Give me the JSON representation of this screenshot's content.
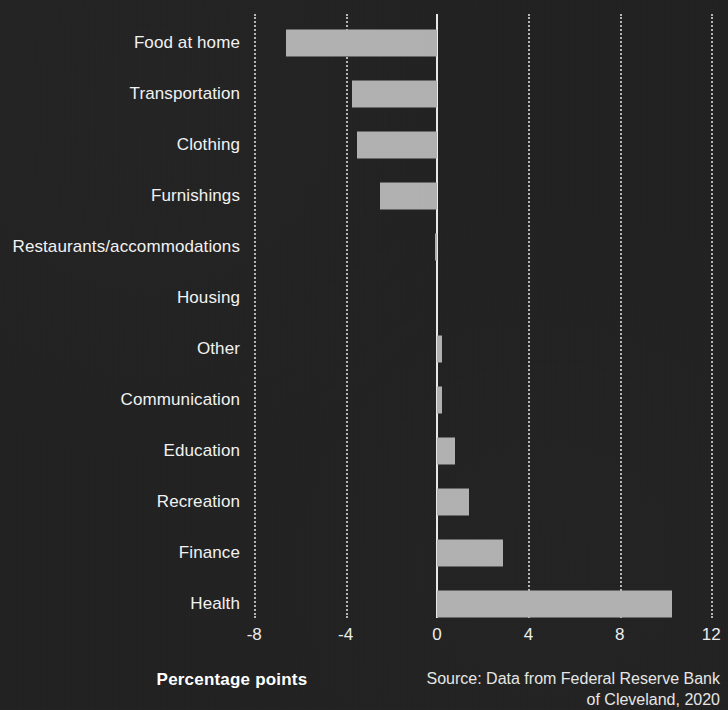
{
  "theme": {
    "background": "#212121",
    "bar_color": "#b0b0b0",
    "text_color": "#f2f2f2",
    "grid_color": "#cfcfcf",
    "zero_line_color": "#e8e8e8"
  },
  "footer": {
    "axis_title": "Percentage points",
    "source_line1": "Source: Data from Federal Reserve Bank",
    "source_line2": "of Cleveland, 2020"
  },
  "chart_data": {
    "type": "bar",
    "orientation": "horizontal",
    "title": "",
    "subtitle": "",
    "xlabel": "Percentage points",
    "ylabel": "",
    "xlim": [
      -8,
      12
    ],
    "xticks": [
      -8,
      -4,
      0,
      4,
      8,
      12
    ],
    "xtick_labels": [
      "-8",
      "-4",
      "0",
      "4",
      "8",
      "12"
    ],
    "grid": "vertical-dotted",
    "legend": "none",
    "zero_reference_line": true,
    "categories": [
      "Food at home",
      "Transportation",
      "Clothing",
      "Furnishings",
      "Restaurants/accommodations",
      "Housing",
      "Other",
      "Communication",
      "Education",
      "Recreation",
      "Finance",
      "Health"
    ],
    "values": [
      -6.6,
      -3.7,
      -3.5,
      -2.5,
      -0.1,
      0.0,
      0.2,
      0.2,
      0.8,
      1.4,
      2.9,
      10.3
    ],
    "annotations": [
      "Source: Data from Federal Reserve Bank of Cleveland, 2020"
    ]
  }
}
